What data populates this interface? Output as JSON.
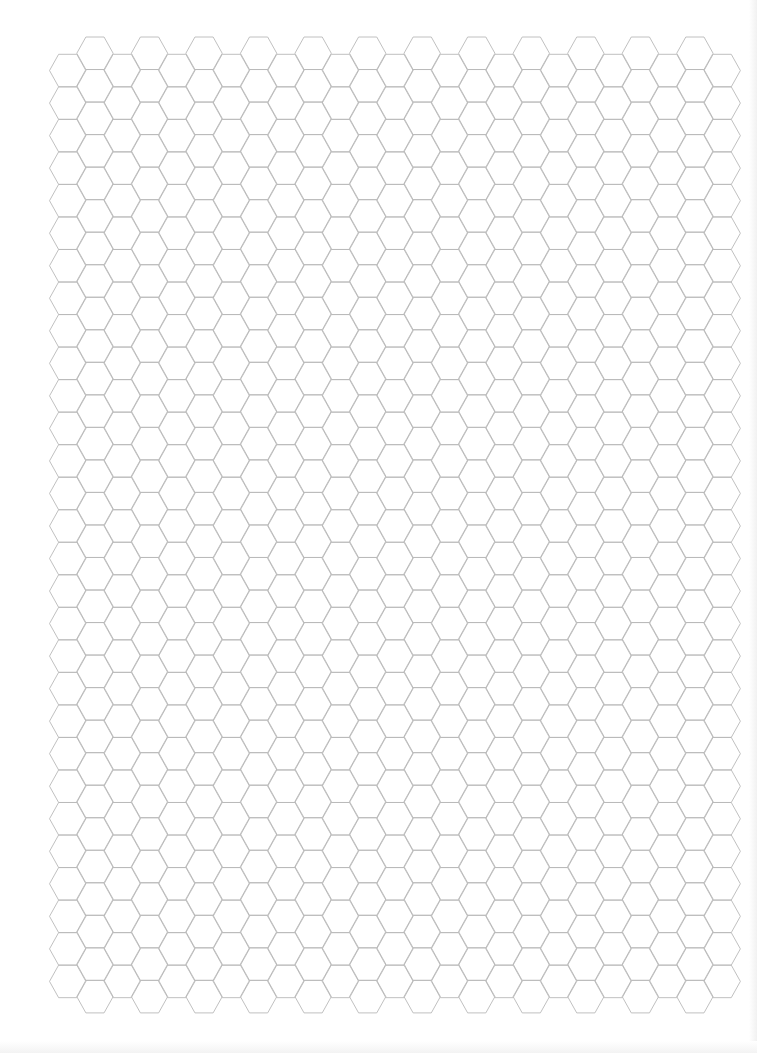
{
  "page": {
    "background": "#ffffff"
  },
  "hex_grid": {
    "orientation": "flat-top",
    "line_color": "#b9b9b9",
    "columns": 25,
    "first_column_center_x": 67.7,
    "column_spacing": 27.27,
    "half_width": 18.18,
    "hex_height": 32.53,
    "even_columns": {
      "top_y": 54.3,
      "rows": 29
    },
    "odd_columns": {
      "top_y": 37.0,
      "rows": 30
    }
  }
}
